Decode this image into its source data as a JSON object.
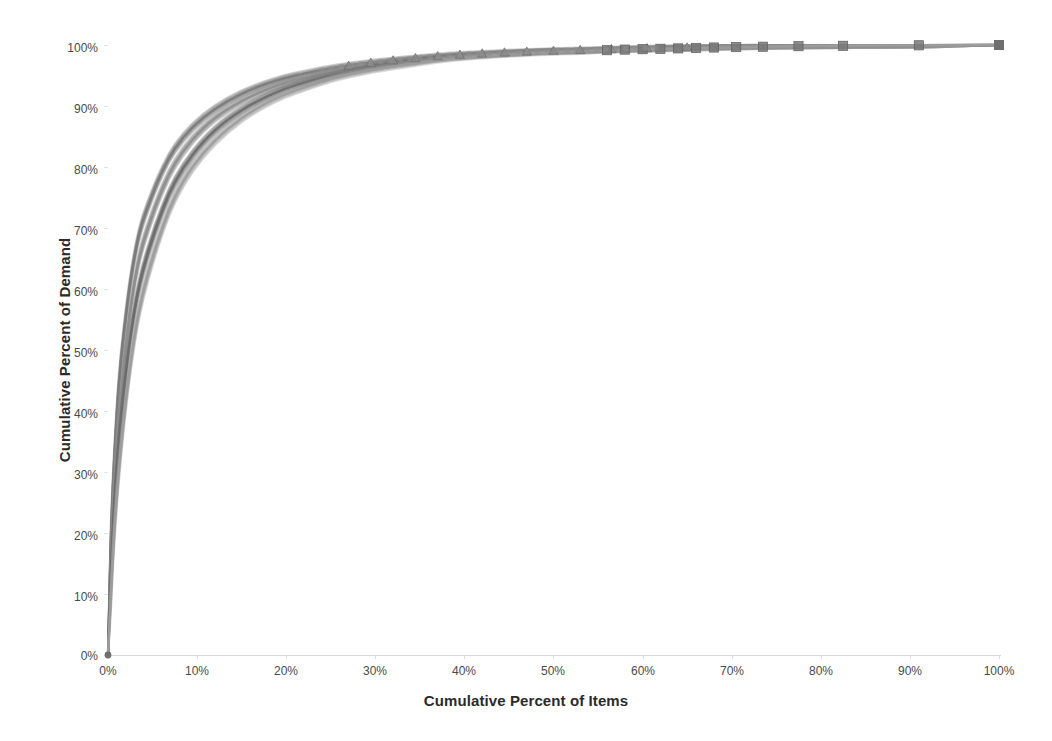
{
  "chart_data": {
    "type": "line",
    "title": "",
    "subtitle": "",
    "xlabel": "Cumulative Percent of Items",
    "ylabel": "Cumulative Percent of Demand",
    "xlim": [
      0,
      100
    ],
    "ylim": [
      0,
      100
    ],
    "grid": false,
    "legend": "none",
    "x_ticks": [
      "0%",
      "10%",
      "20%",
      "30%",
      "40%",
      "50%",
      "60%",
      "70%",
      "80%",
      "90%",
      "100%"
    ],
    "y_ticks": [
      "0%",
      "10%",
      "20%",
      "30%",
      "40%",
      "50%",
      "60%",
      "70%",
      "80%",
      "90%",
      "100%"
    ],
    "x_tick_values": [
      0,
      10,
      20,
      30,
      40,
      50,
      60,
      70,
      80,
      90,
      100
    ],
    "y_tick_values": [
      0,
      10,
      20,
      30,
      40,
      50,
      60,
      70,
      80,
      90,
      100
    ],
    "colors": {
      "series_dark": "#6b6b6b",
      "series_mid": "#8d8d8d",
      "series_light": "#a8a8a8",
      "axis": "#d8d8d8",
      "text": "#4a4a4a",
      "background": "#ffffff"
    },
    "series": [
      {
        "name": "Curve A (upper band)",
        "marker": "triangle",
        "color": "#7a7a7a",
        "x": [
          0,
          0.3,
          0.7,
          1.2,
          1.8,
          2.6,
          3.5,
          4.6,
          6,
          7.5,
          9.5,
          12,
          15,
          18.5,
          22,
          26,
          30,
          34,
          38,
          43,
          48,
          53,
          58,
          64,
          70,
          77,
          84,
          91,
          100
        ],
        "y": [
          0,
          18,
          32,
          44,
          53,
          62,
          69,
          74,
          79,
          83,
          86.5,
          89.5,
          92,
          94,
          95.3,
          96.4,
          97.2,
          97.8,
          98.3,
          98.7,
          99,
          99.2,
          99.4,
          99.6,
          99.75,
          99.85,
          99.92,
          99.97,
          100
        ]
      },
      {
        "name": "Curve B (middle band)",
        "marker": "triangle",
        "color": "#8d8d8d",
        "x": [
          0,
          0.3,
          0.7,
          1.2,
          1.8,
          2.6,
          3.5,
          4.6,
          6,
          7.5,
          9.5,
          12,
          15,
          18.5,
          22,
          26,
          30,
          34,
          38,
          43,
          48,
          53,
          58,
          64,
          70,
          77,
          84,
          91,
          100
        ],
        "y": [
          0,
          15,
          28,
          39,
          48,
          57.5,
          65,
          70.5,
          76,
          80.5,
          84.5,
          88,
          90.8,
          93.1,
          94.6,
          95.9,
          96.8,
          97.5,
          98.1,
          98.5,
          98.9,
          99.1,
          99.3,
          99.5,
          99.7,
          99.82,
          99.9,
          99.96,
          100
        ]
      },
      {
        "name": "Curve C (lower band)",
        "marker": "square",
        "color": "#6b6b6b",
        "x": [
          0,
          0.3,
          0.7,
          1.2,
          1.8,
          2.6,
          3.5,
          4.6,
          6,
          7.5,
          9.5,
          12,
          15,
          18.5,
          22,
          26,
          30,
          34,
          38,
          43,
          48,
          53,
          58,
          64,
          70,
          77,
          84,
          91,
          100
        ],
        "y": [
          0,
          12,
          24,
          34.5,
          43.5,
          53,
          60.5,
          66.5,
          72.5,
          77.5,
          82,
          86,
          89.3,
          92,
          93.8,
          95.3,
          96.4,
          97.2,
          97.9,
          98.4,
          98.8,
          99.0,
          99.25,
          99.45,
          99.65,
          99.8,
          99.89,
          99.95,
          100
        ]
      },
      {
        "name": "Curve D (lowest band)",
        "marker": "square",
        "color": "#9c9c9c",
        "x": [
          0,
          0.3,
          0.7,
          1.2,
          1.8,
          2.6,
          3.5,
          4.6,
          6,
          7.5,
          9.5,
          12,
          15,
          18.5,
          22,
          26,
          30,
          34,
          38,
          43,
          48,
          53,
          58,
          64,
          70,
          77,
          84,
          91,
          100
        ],
        "y": [
          0,
          9,
          20,
          30,
          39,
          48.5,
          56.5,
          63,
          69.5,
          75,
          80,
          84.3,
          88,
          91,
          93,
          94.8,
          96,
          96.9,
          97.7,
          98.3,
          98.7,
          98.95,
          99.2,
          99.4,
          99.6,
          99.78,
          99.88,
          99.94,
          100
        ]
      }
    ],
    "marker_points": {
      "triangle_x": [
        27,
        29.5,
        32,
        34.5,
        37,
        39.5,
        42,
        44.5,
        47,
        50,
        53,
        56.5,
        60.5,
        65
      ],
      "square_x": [
        56,
        58,
        60,
        62,
        64,
        66,
        68,
        70.5,
        73.5,
        77.5,
        82.5,
        91,
        100
      ]
    }
  }
}
